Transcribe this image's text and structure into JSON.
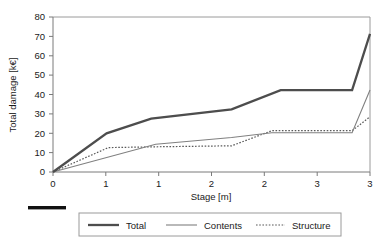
{
  "chart_data": {
    "type": "line",
    "title": "",
    "subtitle": "",
    "xlabel": "Stage [m]",
    "ylabel": "Total damage [k€]",
    "xlim": [
      0,
      3
    ],
    "ylim": [
      0,
      80
    ],
    "grid": false,
    "legend_position": "bottom",
    "x_tick_labels": [
      "0",
      "1",
      "1",
      "2",
      "2",
      "3",
      "3"
    ],
    "x_tick_values": [
      0,
      0.5,
      1,
      1.5,
      2,
      2.5,
      3
    ],
    "y_tick_labels": [
      "0",
      "10",
      "20",
      "30",
      "40",
      "50",
      "60",
      "70",
      "80"
    ],
    "y_tick_values": [
      0,
      10,
      20,
      30,
      40,
      50,
      60,
      70,
      80
    ],
    "series": [
      {
        "name": "Total",
        "style": "thick-solid",
        "color": "#4d4d4d",
        "x": [
          0,
          0.6,
          1.1,
          2.0,
          2.55,
          3.35,
          3.0
        ],
        "points": [
          {
            "x": 0.0,
            "y": 0.0
          },
          {
            "x": 0.6,
            "y": 20.0
          },
          {
            "x": 1.1,
            "y": 27.5
          },
          {
            "x": 2.0,
            "y": 32.3
          },
          {
            "x": 2.55,
            "y": 42.2
          },
          {
            "x": 3.35,
            "y": 42.2
          },
          {
            "x": 3.0,
            "y": 71.3
          }
        ],
        "values": [
          0.0,
          20.0,
          27.5,
          32.3,
          42.2,
          42.2,
          71.3
        ]
      },
      {
        "name": "Contents",
        "style": "thin-solid",
        "color": "#808080",
        "points": [
          {
            "x": 0.0,
            "y": 0.0
          },
          {
            "x": 1.15,
            "y": 14.3
          },
          {
            "x": 2.0,
            "y": 17.8
          },
          {
            "x": 2.45,
            "y": 20.3
          },
          {
            "x": 3.35,
            "y": 20.3
          },
          {
            "x": 3.0,
            "y": 42.3
          }
        ],
        "values": [
          0.0,
          14.3,
          17.8,
          20.3,
          20.3,
          42.3
        ]
      },
      {
        "name": "Structure",
        "style": "dotted",
        "color": "#595959",
        "points": [
          {
            "x": 0.0,
            "y": 0.0
          },
          {
            "x": 0.62,
            "y": 12.6
          },
          {
            "x": 1.15,
            "y": 13.0
          },
          {
            "x": 2.0,
            "y": 13.5
          },
          {
            "x": 2.45,
            "y": 21.3
          },
          {
            "x": 3.35,
            "y": 21.3
          },
          {
            "x": 3.0,
            "y": 28.5
          }
        ],
        "values": [
          0.0,
          12.6,
          13.0,
          13.5,
          21.3,
          21.3,
          28.5
        ]
      }
    ]
  },
  "legend": {
    "items": [
      {
        "label": "Total",
        "style": "thick-solid"
      },
      {
        "label": "Contents",
        "style": "thin-solid"
      },
      {
        "label": "Structure",
        "style": "dotted"
      }
    ]
  },
  "scale_bar": {
    "label": ""
  },
  "colors": {
    "total": "#4d4d4d",
    "contents": "#808080",
    "structure": "#595959",
    "axis": "#808080",
    "text": "#1a1a1a",
    "background": "#ffffff"
  }
}
